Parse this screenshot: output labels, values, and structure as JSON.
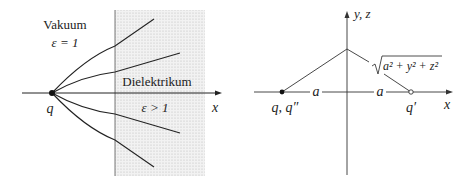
{
  "left_diagram": {
    "region_vacuum": {
      "name": "Vakuum",
      "epsilon": "ε = 1"
    },
    "region_dielectric": {
      "name": "Dielektrikum",
      "epsilon": "ε > 1"
    },
    "charge_label": "q",
    "axis_label": "x",
    "field_lines_count": 4
  },
  "right_diagram": {
    "vertical_axis_label": "y, z",
    "horizontal_axis_label": "x",
    "left_charge_label": "q, q″",
    "right_charge_label": "q′",
    "distance_left": "a",
    "distance_right": "a",
    "distance_formula": "a² + y² + z²"
  },
  "colors": {
    "line": "#222222",
    "dielectric_fill": "#e6e6e6",
    "text": "#222222"
  }
}
